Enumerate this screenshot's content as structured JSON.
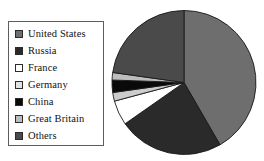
{
  "chart_data": {
    "type": "pie",
    "title": "",
    "legend_position": "left",
    "start_angle": 0,
    "direction": "clockwise",
    "categories": [
      "United States",
      "Russia",
      "France",
      "Germany",
      "China",
      "Great Britain",
      "Others"
    ],
    "values": [
      41.7,
      23.6,
      5.6,
      2.0,
      2.8,
      1.7,
      22.6
    ],
    "unit": "percent",
    "colors": [
      "#6e6e6e",
      "#2a2a2a",
      "#ffffff",
      "#cccccc",
      "#0a0a0a",
      "#bdbdbd",
      "#4a4a4a"
    ],
    "slice_angles_deg": [
      150.0,
      85.0,
      20.0,
      7.0,
      10.0,
      6.0,
      82.0
    ],
    "stroke": "#1a1a1a",
    "grid": false
  },
  "legend": {
    "items": [
      {
        "label": "United States",
        "color": "#6e6e6e",
        "swatch": "legend-swatch-united-states"
      },
      {
        "label": "Russia",
        "color": "#2a2a2a",
        "swatch": "legend-swatch-russia"
      },
      {
        "label": "France",
        "color": "#ffffff",
        "swatch": "legend-swatch-france"
      },
      {
        "label": "Germany",
        "color": "#e2e2e2",
        "swatch": "legend-swatch-germany"
      },
      {
        "label": "China",
        "color": "#0a0a0a",
        "swatch": "legend-swatch-china"
      },
      {
        "label": "Great Britain",
        "color": "#bdbdbd",
        "swatch": "legend-swatch-great-britain"
      },
      {
        "label": "Others",
        "color": "#4a4a4a",
        "swatch": "legend-swatch-others"
      }
    ]
  }
}
